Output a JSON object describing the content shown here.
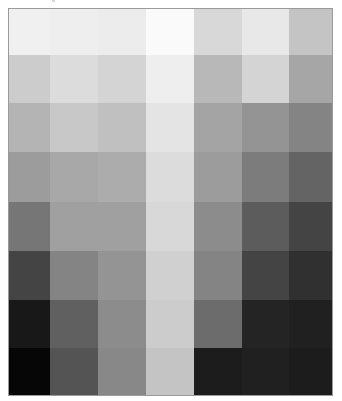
{
  "image": {
    "description": "Grayscale tonal grid scan (7 columns x 8 rows of gray patches)",
    "columns": 7,
    "rows": 8,
    "border_color": "#9a9a9a",
    "background": "#ffffff"
  },
  "grid": {
    "cells": [
      [
        "#f0f0f0",
        "#eeeeee",
        "#ececec",
        "#fafafa",
        "#d8d8d8",
        "#e8e8e8",
        "#c4c4c4"
      ],
      [
        "#cccccc",
        "#dcdcdc",
        "#d4d4d4",
        "#eeeeee",
        "#b8b8b8",
        "#d4d4d4",
        "#a6a6a6"
      ],
      [
        "#b4b4b4",
        "#c8c8c8",
        "#c0c0c0",
        "#e4e4e4",
        "#a4a4a4",
        "#949494",
        "#848484"
      ],
      [
        "#9c9c9c",
        "#a8a8a8",
        "#acacac",
        "#dcdcdc",
        "#9c9c9c",
        "#7c7c7c",
        "#646464"
      ],
      [
        "#767676",
        "#a0a0a0",
        "#a0a0a0",
        "#d8d8d8",
        "#8c8c8c",
        "#5c5c5c",
        "#444444"
      ],
      [
        "#444444",
        "#848484",
        "#949494",
        "#d0d0d0",
        "#848484",
        "#444444",
        "#303030"
      ],
      [
        "#181818",
        "#606060",
        "#8c8c8c",
        "#cccccc",
        "#6c6c6c",
        "#242424",
        "#202020"
      ],
      [
        "#060606",
        "#545454",
        "#888888",
        "#c4c4c4",
        "#1c1c1c",
        "#202020",
        "#1c1c1c"
      ]
    ]
  }
}
